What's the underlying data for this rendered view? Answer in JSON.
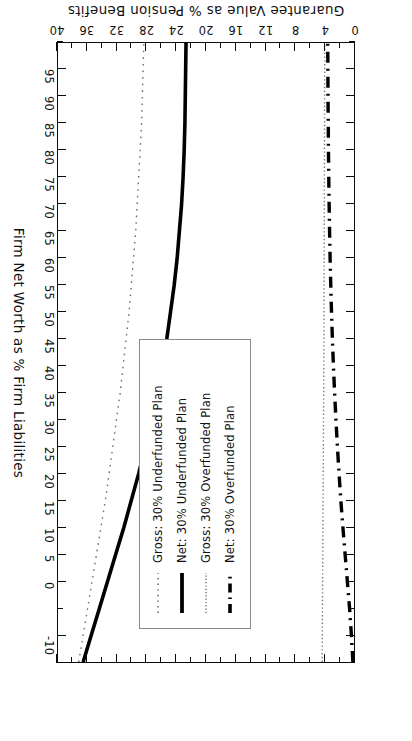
{
  "chart_data": {
    "type": "line",
    "title": "",
    "xlabel": "Firm Net Worth as % Firm Liabilities",
    "ylabel": "Guarantee Value as % Pension Benefits",
    "xlim": [
      -15,
      100
    ],
    "ylim": [
      0,
      40
    ],
    "xticks": [
      -10,
      0,
      5,
      10,
      15,
      20,
      25,
      30,
      35,
      40,
      45,
      50,
      55,
      60,
      65,
      70,
      75,
      80,
      85,
      90,
      95
    ],
    "xtick_labels": [
      "-10",
      "0",
      "5",
      "10",
      "15",
      "20",
      "25",
      "30",
      "35",
      "40",
      "45",
      "50",
      "55",
      "60",
      "65",
      "70",
      "75",
      "80",
      "85",
      "90",
      "95"
    ],
    "yticks": [
      0,
      4,
      8,
      12,
      16,
      20,
      24,
      28,
      32,
      36,
      40
    ],
    "ytick_labels": [
      "0",
      "4",
      "8",
      "12",
      "16",
      "20",
      "24",
      "28",
      "32",
      "36",
      "40"
    ],
    "grid": false,
    "legend_position": "center",
    "x": [
      -15,
      -10,
      -5,
      0,
      5,
      10,
      15,
      20,
      25,
      30,
      35,
      40,
      45,
      50,
      55,
      60,
      65,
      70,
      75,
      80,
      85,
      90,
      95,
      100
    ],
    "series": [
      {
        "name": "Gross: 30% Underfunded Plan",
        "style": "dotted-sparse",
        "width": 1.4,
        "color": "#6e6e6e",
        "values": [
          37.2,
          36.6,
          36.0,
          35.4,
          34.8,
          34.2,
          33.6,
          33.1,
          32.6,
          32.1,
          31.6,
          31.2,
          30.8,
          30.4,
          30.1,
          29.8,
          29.5,
          29.3,
          29.1,
          28.9,
          28.7,
          28.6,
          28.5,
          28.4
        ]
      },
      {
        "name": "Net: 30% Underfunded Plan",
        "style": "solid",
        "width": 3.6,
        "color": "#000000",
        "values": [
          36.6,
          35.5,
          34.4,
          33.3,
          32.2,
          31.1,
          30.1,
          29.1,
          28.2,
          27.4,
          26.6,
          25.9,
          25.3,
          24.8,
          24.3,
          23.9,
          23.6,
          23.3,
          23.1,
          22.95,
          22.85,
          22.8,
          22.75,
          22.7
        ]
      },
      {
        "name": "Gross: 30% Overfunded Plan",
        "style": "dotted-dense",
        "width": 1.4,
        "color": "#7a7a7a",
        "values": [
          4.3,
          4.28,
          4.26,
          4.24,
          4.22,
          4.2,
          4.18,
          4.16,
          4.14,
          4.12,
          4.1,
          4.08,
          4.06,
          4.05,
          4.04,
          4.03,
          4.02,
          4.01,
          4.0,
          3.99,
          3.98,
          3.97,
          3.96,
          3.95
        ]
      },
      {
        "name": "Net: 30% Overfunded Plan",
        "style": "dash",
        "width": 3.4,
        "color": "#000000",
        "values": [
          0.15,
          0.35,
          0.6,
          0.9,
          1.2,
          1.5,
          1.78,
          2.02,
          2.24,
          2.44,
          2.62,
          2.78,
          2.92,
          3.04,
          3.14,
          3.23,
          3.3,
          3.36,
          3.41,
          3.45,
          3.48,
          3.51,
          3.53,
          3.55
        ]
      }
    ]
  },
  "legend": {
    "entries": [
      "Gross: 30% Underfunded Plan",
      "Net: 30% Underfunded Plan",
      "Gross: 30% Overfunded Plan",
      "Net: 30% Overfunded Plan"
    ]
  },
  "axes": {
    "x_title": "Firm Net Worth as % Firm Liabilities",
    "y_title": "Guarantee Value as % Pension Benefits"
  }
}
